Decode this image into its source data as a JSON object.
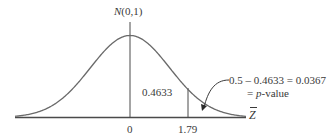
{
  "chart_data": {
    "type": "area",
    "title": "",
    "distribution_label": "N(0,1)",
    "xlabel": "Z̄",
    "ylabel": "",
    "x_ticks": [
      "0",
      "1.79"
    ],
    "x_tick_values": [
      0,
      1.79
    ],
    "curve": "standard normal density",
    "shaded_regions": [
      {
        "from": 0,
        "to": 1.79,
        "area": 0.4633,
        "label": "0.4633"
      },
      {
        "from": 1.79,
        "to": "inf",
        "area": 0.0367,
        "label": "p-value"
      }
    ],
    "annotations": [
      {
        "text": "0.5 – 0.4633 = 0.0367",
        "points_to": "right tail beyond 1.79"
      },
      {
        "text": "= p-value"
      }
    ],
    "grid": false,
    "legend": null
  },
  "labels": {
    "distribution_prefix": "N",
    "distribution_params": "(0,1)",
    "area_center": "0.4633",
    "tick_zero": "0",
    "tick_z": "1.79",
    "axis_var": "Z",
    "annot_line1": "0.5 – 0.4633 = 0.0367",
    "annot_line2_eq": "= ",
    "annot_line2_p": "p",
    "annot_line2_rest": "-value"
  },
  "colors": {
    "curve": "#6a6a6a",
    "axis": "#4a4a4a",
    "text": "#3a3a3a"
  }
}
